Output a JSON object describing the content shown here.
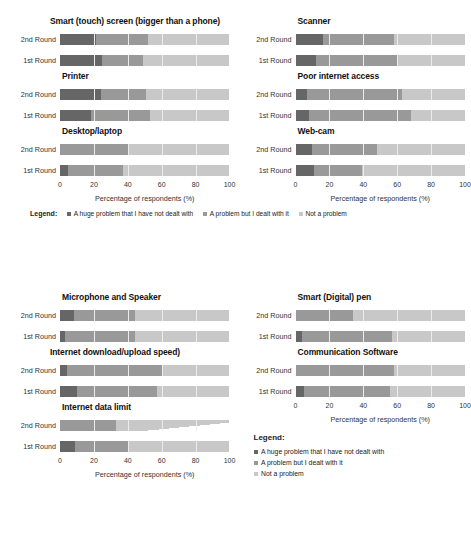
{
  "chart_data": {
    "type": "bar",
    "subtype": "100% stacked horizontal bar, small multiples",
    "title": "",
    "xlabel": "Percentage of respondents (%)",
    "ylabel": "",
    "xlim": [
      0,
      100
    ],
    "xticks": [
      "0",
      "20",
      "40",
      "60",
      "80",
      "100"
    ],
    "grid": true,
    "legend_position": "below-axis",
    "series": [
      {
        "name": "A huge problem that I have not dealt with",
        "color": "#666666"
      },
      {
        "name": "A problem but I dealt with it",
        "color": "#999999"
      },
      {
        "name": "Not a problem",
        "color": "#c8c8c8"
      }
    ],
    "categories": [
      "2nd Round",
      "1st Round"
    ],
    "groups": [
      {
        "id": "top",
        "xlabel": "Percentage of respondents (%)",
        "legend_label": "Legend:",
        "panels": [
          {
            "title": "Smart (touch) screen (bigger than a phone)",
            "rows": [
              {
                "label": "2nd Round",
                "values": [
                  21,
                  31,
                  48
                ]
              },
              {
                "label": "1st Round",
                "values": [
                  25,
                  24,
                  51
                ]
              }
            ]
          },
          {
            "title": "Scanner",
            "rows": [
              {
                "label": "2nd Round",
                "values": [
                  16,
                  42,
                  42
                ]
              },
              {
                "label": "1st Round",
                "values": [
                  12,
                  48,
                  40
                ]
              }
            ]
          },
          {
            "title": "Printer",
            "rows": [
              {
                "label": "2nd Round",
                "values": [
                  24,
                  27,
                  49
                ]
              },
              {
                "label": "1st Round",
                "values": [
                  18,
                  35,
                  47
                ]
              }
            ]
          },
          {
            "title": "Poor internet access",
            "rows": [
              {
                "label": "2nd Round",
                "values": [
                  7,
                  56,
                  37
                ]
              },
              {
                "label": "1st Round",
                "values": [
                  8,
                  60,
                  32
                ]
              }
            ]
          },
          {
            "title": "Desktop/laptop",
            "rows": [
              {
                "label": "2nd Round",
                "values": [
                  0,
                  41,
                  59
                ]
              },
              {
                "label": "1st Round",
                "values": [
                  5,
                  32,
                  63
                ]
              }
            ]
          },
          {
            "title": "Web-cam",
            "rows": [
              {
                "label": "2nd Round",
                "values": [
                  10,
                  38,
                  52
                ]
              },
              {
                "label": "1st Round",
                "values": [
                  11,
                  28,
                  61
                ]
              }
            ]
          }
        ]
      },
      {
        "id": "bottom",
        "xlabel": "Percentage of respondents (%)",
        "legend_label": "Legend:",
        "panels": [
          {
            "title": "Microphone and Speaker",
            "rows": [
              {
                "label": "2nd Round",
                "values": [
                  8,
                  36,
                  56
                ]
              },
              {
                "label": "1st Round",
                "values": [
                  3,
                  41,
                  56
                ]
              }
            ]
          },
          {
            "title": "Smart (Digital) pen",
            "rows": [
              {
                "label": "2nd Round",
                "values": [
                  0,
                  34,
                  66
                ]
              },
              {
                "label": "1st Round",
                "values": [
                  4,
                  53,
                  43
                ]
              }
            ]
          },
          {
            "title": "Internet download/upload speed)",
            "rows": [
              {
                "label": "2nd Round",
                "values": [
                  4,
                  57,
                  39
                ]
              },
              {
                "label": "1st Round",
                "values": [
                  10,
                  47,
                  43
                ]
              }
            ]
          },
          {
            "title": "Communication Software",
            "rows": [
              {
                "label": "2nd Round",
                "values": [
                  0,
                  58,
                  42
                ]
              },
              {
                "label": "1st Round",
                "values": [
                  5,
                  51,
                  44
                ]
              }
            ]
          },
          {
            "title": "Internet data limit",
            "rows": [
              {
                "label": "2nd Round",
                "values": [
                  0,
                  33,
                  67
                ],
                "taper": true
              },
              {
                "label": "1st Round",
                "values": [
                  9,
                  31,
                  60
                ]
              }
            ]
          }
        ]
      }
    ]
  }
}
